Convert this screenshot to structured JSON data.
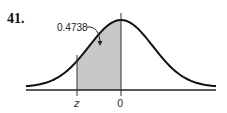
{
  "problem": {
    "number": "41."
  },
  "diagram": {
    "type": "normal-distribution-curve",
    "shaded_area_label": "0.4738",
    "x_axis_labels": [
      "z",
      "0"
    ],
    "shaded_region": {
      "from": "z",
      "to": "0",
      "area": 0.4738
    },
    "colors": {
      "shade": "#c8c8c8",
      "curve": "#111111",
      "axis": "#222222"
    }
  }
}
